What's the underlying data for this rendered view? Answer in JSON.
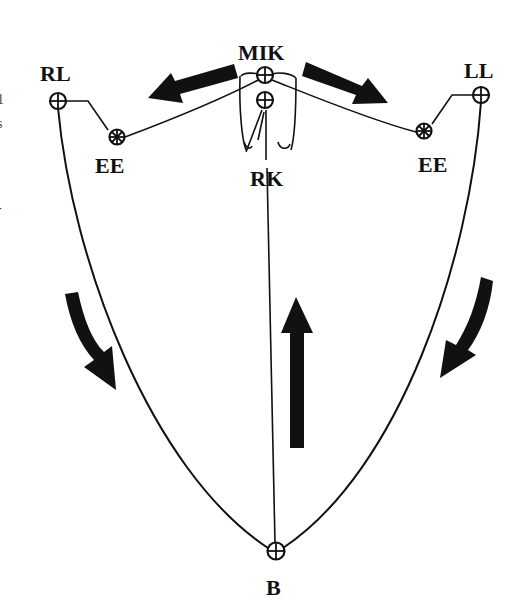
{
  "diagram": {
    "labels": {
      "mik": "MIK",
      "rl": "RL",
      "ll": "LL",
      "ee_right": "EE",
      "ee_left": "EE",
      "rk": "RK",
      "b": "B"
    },
    "edge_fragments": [
      "1",
      "s",
      "-"
    ],
    "points": {
      "MIK": [
        265,
        75
      ],
      "RK": [
        265,
        100
      ],
      "RL": [
        58,
        100
      ],
      "LL": [
        481,
        94
      ],
      "EE_right": [
        117,
        136
      ],
      "EE_left": [
        424,
        131
      ],
      "B": [
        275,
        551
      ]
    },
    "arrows": [
      {
        "id": "upper-left",
        "direction": "left-down",
        "from": [
          232,
          70
        ],
        "to": [
          150,
          100
        ]
      },
      {
        "id": "upper-right",
        "direction": "right-down",
        "from": [
          308,
          66
        ],
        "to": [
          388,
          103
        ]
      },
      {
        "id": "lower-left",
        "direction": "down-curved",
        "from": [
          70,
          295
        ],
        "to": [
          112,
          390
        ]
      },
      {
        "id": "lower-right",
        "direction": "down-curved-left",
        "from": [
          488,
          280
        ],
        "to": [
          442,
          378
        ]
      },
      {
        "id": "center",
        "direction": "up",
        "from": [
          295,
          450
        ],
        "to": [
          295,
          300
        ]
      }
    ],
    "colors": {
      "ink": "#111111",
      "background": "#ffffff"
    }
  }
}
